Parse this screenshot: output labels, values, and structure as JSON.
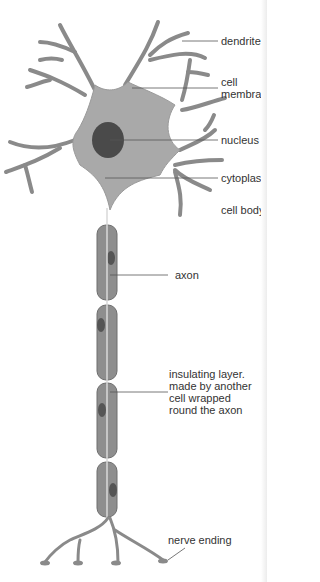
{
  "colors": {
    "cell_fill": "#a9a9a9",
    "cell_stroke": "#8a8a8a",
    "segment_fill": "#8e8e8e",
    "segment_stroke": "#6e6e6e",
    "nucleus_fill": "#4a4a4a",
    "axon_line": "#d9d9d9",
    "leader_line": "#555555",
    "text": "#333333"
  },
  "labels": {
    "dendrite": "dendrite",
    "cell_membrane_1": "cell",
    "cell_membrane_2": "membra",
    "nucleus": "nucleus",
    "cytoplasm": "cytoplas",
    "cell_body": "cell body",
    "axon": "axon",
    "insulating_1": "insulating layer.",
    "insulating_2": "made by another",
    "insulating_3": "cell wrapped",
    "insulating_4": "round the axon",
    "nerve_ending": "nerve ending"
  }
}
